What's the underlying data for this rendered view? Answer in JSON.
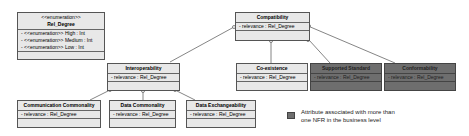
{
  "enumeration": {
    "stereotype": "<<enumeration>>",
    "name": "Rel_Degree",
    "literals": [
      "- <<enumeration>> High : Int",
      "- <<enumeration>> Medium : Int",
      "- <<enumeration>> Low : Int"
    ]
  },
  "classes": {
    "compatibility": {
      "name": "Compatibility",
      "attr": "- relevance : Rel_Degree"
    },
    "interoperability": {
      "name": "Interoperability",
      "attr": "- relevance : Rel_Degree"
    },
    "coexistence": {
      "name": "Co-existence",
      "attr": "- relevance : Rel_Degree"
    },
    "supported_standard": {
      "name": "Supported Standard",
      "attr": "- relevance : Rel_Degree"
    },
    "conformability": {
      "name": "Conformability",
      "attr": "- relevance : Rel_Degree"
    },
    "communication_commonality": {
      "name": "Communication Commonality",
      "attr": "- relevance : Rel_Degree"
    },
    "data_commonality": {
      "name": "Data Commonality",
      "attr": "- relevance : Rel_Degree"
    },
    "data_exchangeability": {
      "name": "Data Exchangeability",
      "attr": "- relevance : Rel_Degree"
    }
  },
  "legend": {
    "text_line1": "Attribute associated with more than",
    "text_line2": "one NFR in the business level",
    "swatch_color": "#6e6e6e"
  }
}
